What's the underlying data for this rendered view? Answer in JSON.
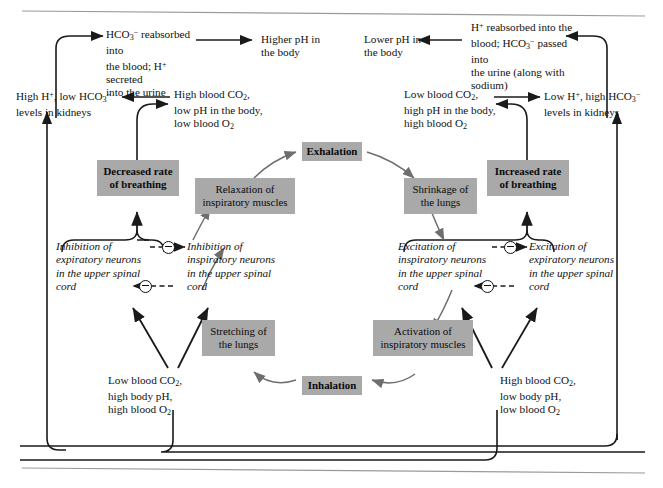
{
  "figure": {
    "type": "physiology-flow-diagram",
    "title_rule_top": true,
    "title_rule_bottom": true
  },
  "boxes": {
    "decreased_breathing": "Decreased rate\nof breathing",
    "increased_breathing": "Increased rate\nof breathing",
    "exhalation": "Exhalation",
    "inhalation": "Inhalation",
    "relaxation": "Relaxation of\ninspiratory muscles",
    "shrinkage": "Shrinkage of\nthe lungs",
    "stretching": "Stretching of\nthe lungs",
    "activation": "Activation of\ninspiratory muscles"
  },
  "texts": {
    "hco3_reabsorbed": "HCO3- reabsorbed into the blood; H+ secreted into the urine",
    "higher_ph": "Higher pH in the body",
    "lower_ph": "Lower pH in the body",
    "h_reabsorbed": "H+ reabsorbed into the blood; HCO3- passed into the urine (along with sodium)",
    "high_h_low_hco3": "High H+, low HCO3- levels in kidneys",
    "low_h_high_hco3": "Low H+, high HCO3- levels in kidneys",
    "high_co2_low_ph": "High blood CO2, low pH in the body, low blood O2",
    "low_co2_high_ph": "Low blood CO2, high pH in the body, high blood O2",
    "low_co2_high_body_ph": "Low blood CO2, high body pH, high blood O2",
    "high_co2_low_body_ph": "High blood CO2, low body pH, low blood O2",
    "inhibition_expiratory": "Inhibition of expiratory neurons in the upper spinal cord",
    "inhibition_inspiratory": "Inhibition of inspiratory neurons in the upper spinal cord",
    "excitation_inspiratory": "Excitation of inspiratory neurons in the upper spinal cord",
    "excitation_expiratory": "Excitation of expiratory neurons in the upper spinal cord"
  },
  "symbols": {
    "inhibitory_sign": "minus-in-circle",
    "count": 4
  },
  "colors": {
    "box_fill": "#a9a9a9",
    "text": "#111111",
    "arrow_dark": "#1a1a1a",
    "arrow_gray": "#6e6e6e",
    "rule": "#9a9a9a"
  }
}
